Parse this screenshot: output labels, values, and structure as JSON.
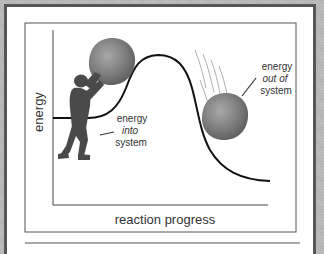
{
  "diagram": {
    "y_axis_label": "energy",
    "x_axis_label": "reaction progress",
    "annotations": [
      {
        "id": "energy-into",
        "lines": [
          "energy",
          "into",
          "system"
        ],
        "italic_line": 1
      },
      {
        "id": "energy-out",
        "lines": [
          "energy",
          "out of",
          "system"
        ],
        "italic_line": 1
      }
    ],
    "figures": {
      "person": "person-pushing-boulder",
      "boulder_top": "boulder-at-peak",
      "boulder_falling": "boulder-rolling-down"
    }
  },
  "colors": {
    "frame_border": "#555555",
    "curve": "#111111",
    "axis": "#444444",
    "boulder": "#7d7d7d",
    "person": "#4a4a4a",
    "text": "#333333"
  }
}
